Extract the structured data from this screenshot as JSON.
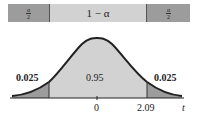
{
  "bar": {
    "left": {
      "num": "α",
      "den": "2"
    },
    "middle": "1 − α",
    "right": {
      "num": "α",
      "den": "2"
    }
  },
  "curve": {
    "labels": {
      "left_tail": "0.025",
      "center": "0.95",
      "right_tail": "0.025"
    },
    "ticks": {
      "zero": "0",
      "critical": "2.09",
      "axis": "t"
    }
  },
  "colors": {
    "tail": "#9c9c9c",
    "center": "#d2d2d2",
    "curve": "#222222"
  }
}
